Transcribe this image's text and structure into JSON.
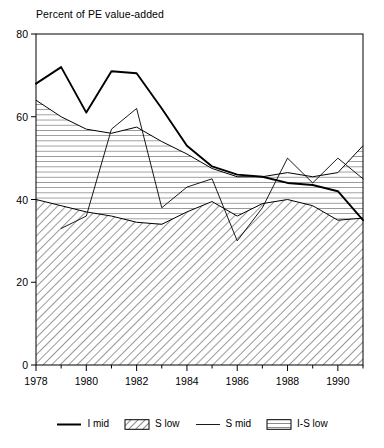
{
  "chart_data": {
    "type": "area",
    "title": "Percent of PE value-added",
    "xlabel": "",
    "ylabel": "",
    "xlim": [
      1978,
      1991
    ],
    "ylim": [
      0,
      80
    ],
    "yticks": [
      0,
      20,
      40,
      60,
      80
    ],
    "xticks": [
      1978,
      1980,
      1982,
      1984,
      1986,
      1988,
      1990
    ],
    "xtick_labels": [
      "1978",
      "1980",
      "1982",
      "1984",
      "1986",
      "1988",
      "1990"
    ],
    "ytick_labels": [
      "0",
      "20",
      "40",
      "60",
      "80"
    ],
    "grid": false,
    "legend_position": "bottom",
    "x": [
      1978,
      1979,
      1980,
      1981,
      1982,
      1983,
      1984,
      1985,
      1986,
      1987,
      1988,
      1989,
      1990,
      1991
    ],
    "series": [
      {
        "name": "I mid",
        "style": "line-thick",
        "color": "#000000",
        "values": [
          68,
          72,
          61,
          71,
          70.5,
          62,
          53,
          48,
          46,
          45.5,
          44,
          43.5,
          42,
          35
        ]
      },
      {
        "name": "S low",
        "style": "area-diagonal-hatch",
        "color": "#000000",
        "values": [
          40,
          38.5,
          37,
          36,
          34.5,
          34,
          37,
          39.5,
          36,
          39,
          40,
          38.5,
          35,
          35.5
        ]
      },
      {
        "name": "S mid",
        "style": "line-thin",
        "color": "#000000",
        "values": [
          null,
          33,
          36,
          57,
          62,
          38,
          43,
          45,
          30,
          38,
          50,
          44,
          50,
          45
        ]
      },
      {
        "name": "I-S low",
        "style": "area-horizontal-hatch",
        "color": "#000000",
        "values": [
          64,
          60,
          57,
          56,
          57.5,
          54,
          51,
          47.5,
          45.5,
          45.5,
          46.5,
          45.5,
          46.5,
          53
        ]
      }
    ]
  },
  "legend": {
    "items": [
      {
        "label": "I mid",
        "swatch": "line-thick"
      },
      {
        "label": "S low",
        "swatch": "hatch-diagonal"
      },
      {
        "label": "S mid",
        "swatch": "line-thin"
      },
      {
        "label": "I-S low",
        "swatch": "hatch-horizontal"
      }
    ]
  }
}
